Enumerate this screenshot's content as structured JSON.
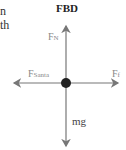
{
  "fragments": {
    "line1": "n",
    "line2": "th"
  },
  "diagram": {
    "title": "FBD",
    "forces": {
      "normal": {
        "label": "F",
        "sub": "N"
      },
      "santa": {
        "label": "F",
        "sub": "Santa"
      },
      "friction": {
        "label": "F",
        "sub": "f"
      },
      "gravity": {
        "label": "mg"
      }
    },
    "colors": {
      "arrow": "#777777",
      "dot": "#222222"
    }
  }
}
